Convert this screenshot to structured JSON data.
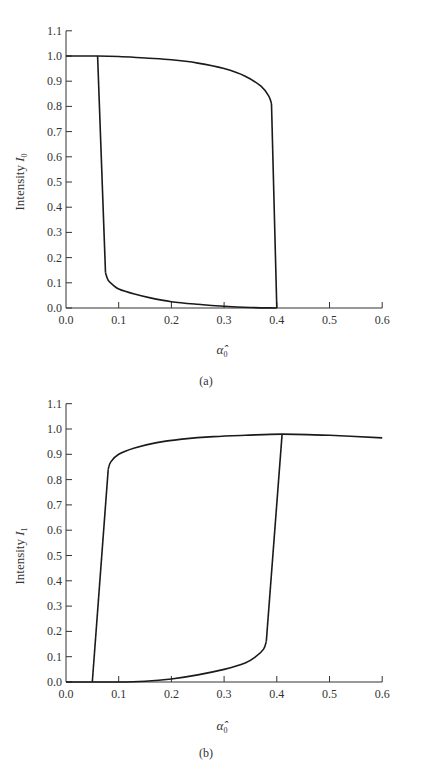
{
  "chart_data": [
    {
      "type": "line",
      "panel": "(a)",
      "title": "",
      "xlabel": "α̂₀",
      "ylabel": "Intensity I₀",
      "xlim": [
        0.0,
        0.6
      ],
      "ylim": [
        0.0,
        1.1
      ],
      "xticks": [
        "0.0",
        "0.1",
        "0.2",
        "0.3",
        "0.4",
        "0.5",
        "0.6"
      ],
      "yticks": [
        "0.0",
        "0.1",
        "0.2",
        "0.3",
        "0.4",
        "0.5",
        "0.6",
        "0.7",
        "0.8",
        "0.9",
        "1.0",
        "1.1"
      ],
      "grid": false,
      "series": [
        {
          "name": "upper branch",
          "x": [
            0.0,
            0.06,
            0.1,
            0.15,
            0.2,
            0.25,
            0.3,
            0.34,
            0.37,
            0.385,
            0.39
          ],
          "y": [
            1.0,
            1.0,
            0.998,
            0.992,
            0.985,
            0.972,
            0.95,
            0.92,
            0.88,
            0.84,
            0.81
          ]
        },
        {
          "name": "lower branch",
          "x": [
            0.075,
            0.08,
            0.09,
            0.1,
            0.13,
            0.16,
            0.2,
            0.25,
            0.3,
            0.35,
            0.4
          ],
          "y": [
            0.14,
            0.11,
            0.09,
            0.075,
            0.055,
            0.04,
            0.025,
            0.015,
            0.007,
            0.002,
            0.0
          ]
        },
        {
          "name": "downward jump",
          "x": [
            0.06,
            0.075
          ],
          "y": [
            1.0,
            0.14
          ]
        },
        {
          "name": "upward/right jump",
          "x": [
            0.39,
            0.4
          ],
          "y": [
            0.81,
            0.0
          ]
        }
      ]
    },
    {
      "type": "line",
      "panel": "(b)",
      "title": "",
      "xlabel": "α̂₀",
      "ylabel": "Intensity I₁",
      "xlim": [
        0.0,
        0.6
      ],
      "ylim": [
        0.0,
        1.1
      ],
      "xticks": [
        "0.0",
        "0.1",
        "0.2",
        "0.3",
        "0.4",
        "0.5",
        "0.6"
      ],
      "yticks": [
        "0.0",
        "0.1",
        "0.2",
        "0.3",
        "0.4",
        "0.5",
        "0.6",
        "0.7",
        "0.8",
        "0.9",
        "1.0",
        "1.1"
      ],
      "grid": false,
      "series": [
        {
          "name": "upper branch",
          "x": [
            0.08,
            0.085,
            0.1,
            0.13,
            0.17,
            0.22,
            0.28,
            0.34,
            0.41,
            0.5,
            0.6
          ],
          "y": [
            0.84,
            0.87,
            0.9,
            0.925,
            0.945,
            0.96,
            0.97,
            0.975,
            0.98,
            0.975,
            0.965
          ]
        },
        {
          "name": "lower branch",
          "x": [
            0.0,
            0.05,
            0.1,
            0.15,
            0.2,
            0.25,
            0.3,
            0.34,
            0.36,
            0.375,
            0.38
          ],
          "y": [
            0.0,
            0.0,
            0.0,
            0.003,
            0.012,
            0.028,
            0.05,
            0.075,
            0.1,
            0.13,
            0.16
          ]
        },
        {
          "name": "left jump",
          "x": [
            0.05,
            0.08
          ],
          "y": [
            0.0,
            0.84
          ]
        },
        {
          "name": "right jump",
          "x": [
            0.38,
            0.41
          ],
          "y": [
            0.16,
            0.98
          ]
        }
      ]
    }
  ],
  "panels": {
    "a": {
      "ylabel": "Intensity ",
      "ylabel_var": "I",
      "ylabel_sub": "0",
      "xlabel_var": "α̂",
      "xlabel_sub": "0",
      "caption": "(a)"
    },
    "b": {
      "ylabel": "Intensity ",
      "ylabel_var": "I",
      "ylabel_sub": "1",
      "xlabel_var": "α̂",
      "xlabel_sub": "0",
      "caption": "(b)"
    }
  }
}
